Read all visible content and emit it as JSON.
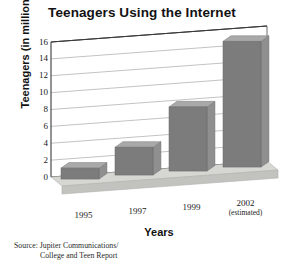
{
  "chart_data": {
    "type": "bar",
    "title": "Teenagers Using the Internet",
    "xlabel": "Years",
    "ylabel": "Teenagers (in millions)",
    "categories": [
      "1995",
      "1997",
      "1999",
      "2002"
    ],
    "category_sublabels": [
      "",
      "",
      "",
      "(estimated)"
    ],
    "values": [
      1.3,
      3.3,
      7.6,
      14.9
    ],
    "ylim": [
      0,
      16
    ],
    "yticks": [
      0,
      2,
      4,
      6,
      8,
      10,
      12,
      14,
      16
    ],
    "ytick_labels": [
      "0",
      "2",
      "4",
      "6",
      "8",
      "10",
      "12",
      "14",
      "16"
    ],
    "grid": true,
    "legend": "none",
    "style": "3d-bar",
    "source": "Source: Jupiter Communications/ College and Teen Report",
    "colors": {
      "bar_front": "#7c7c7c",
      "bar_top": "#a9a9a9",
      "bar_side": "#8f8f8f",
      "floor": "#d6d6d2",
      "floor_front": "#c2c2be",
      "gridline": "#9a9a9a",
      "axis": "#3a3a3a",
      "background": "#ffffff",
      "text": "#111111"
    }
  },
  "source_note": {
    "line1": "Source: Jupiter Communications/",
    "line2": "College and Teen Report"
  }
}
